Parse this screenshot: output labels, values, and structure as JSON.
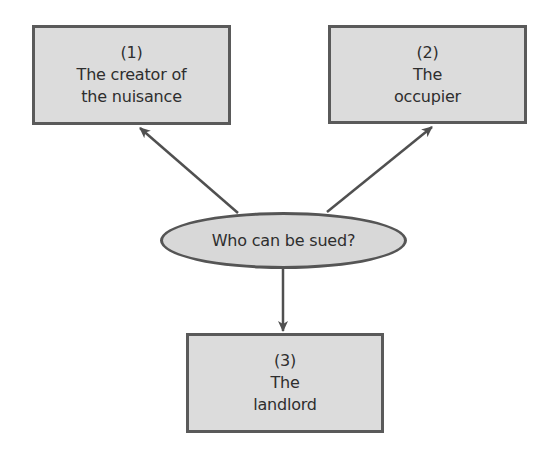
{
  "diagram": {
    "type": "hub-and-spoke",
    "center": {
      "label": "Who can be sued?"
    },
    "nodes": [
      {
        "number": "(1)",
        "line1": "The creator of",
        "line2": "the nuisance"
      },
      {
        "number": "(2)",
        "line1": "The",
        "line2": "occupier"
      },
      {
        "number": "(3)",
        "line1": "The",
        "line2": "landlord"
      }
    ],
    "edges": [
      {
        "from": "center",
        "to": "node-1",
        "direction": "up-left"
      },
      {
        "from": "center",
        "to": "node-2",
        "direction": "up-right"
      },
      {
        "from": "center",
        "to": "node-3",
        "direction": "down"
      }
    ],
    "colors": {
      "box_fill": "#dcdcdc",
      "ellipse_fill": "#d8d8d8",
      "border": "#5a5a5a",
      "arrow": "#505050",
      "text": "#2e2e2e",
      "background": "#ffffff"
    }
  }
}
